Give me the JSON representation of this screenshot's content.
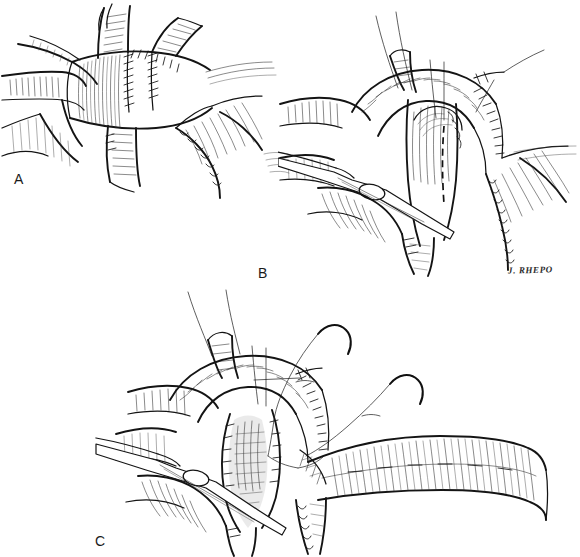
{
  "figure": {
    "kind": "surgical-line-illustration",
    "medium": "pen-and-ink",
    "background_color": "#ffffff",
    "ink_color": "#141414",
    "width": 580,
    "height": 557,
    "panel_count": 3
  },
  "panels": [
    {
      "label": "A",
      "label_x": 14,
      "label_y": 172,
      "caption": "",
      "contents": "Anastomosed vascular/biliary confluence with continuous suture line at junction; branching vessels retracted left and right; adjacent viscus at lower right."
    },
    {
      "label": "B",
      "label_x": 258,
      "label_y": 266,
      "caption": "",
      "contents": "Exposure with angled clamp/forceps holding the structure; stay sutures with long free threads placed superiorly; dashed line marks planned incision on anterior wall; sutured edge continues to the right."
    },
    {
      "label": "C",
      "label_x": 95,
      "label_y": 534,
      "caption": "",
      "contents": "Opened lumen retracted by instrument; two curved needles with suture threads positioned for anastomosis; mobilized bowel limb sweeping to the right across the field."
    }
  ],
  "artist_signature": {
    "text": "J. RHEPO",
    "x": 508,
    "y": 265
  },
  "annotations": {
    "incision_line_style": "dashed",
    "suture_line_style": "running-stitch",
    "needle_count": 2,
    "instrument": "angled-surgical-clamp"
  }
}
